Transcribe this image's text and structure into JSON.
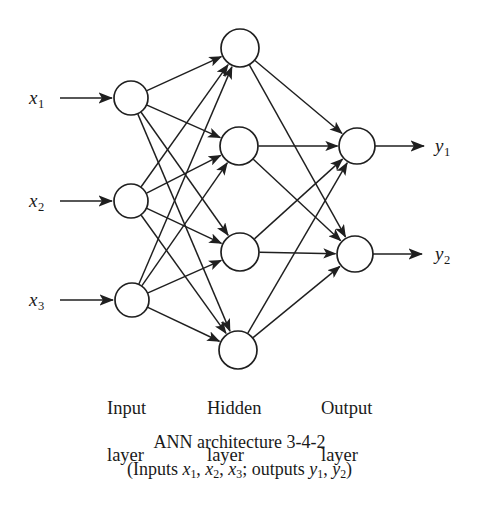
{
  "figure": {
    "title": "ANN architecture 3-4-2",
    "background_color": "#ffffff",
    "stroke_color": "#1f1f1f"
  },
  "inputs": [
    {
      "label": "x",
      "sub": "1",
      "node_id": "input-1"
    },
    {
      "label": "x",
      "sub": "2",
      "node_id": "input-2"
    },
    {
      "label": "x",
      "sub": "3",
      "node_id": "input-3"
    }
  ],
  "outputs": [
    {
      "label": "y",
      "sub": "1",
      "node_id": "output-1"
    },
    {
      "label": "y",
      "sub": "2",
      "node_id": "output-2"
    }
  ],
  "layer_labels": [
    {
      "line1": "Input",
      "line2": "layer"
    },
    {
      "line1": "Hidden",
      "line2": "layer"
    },
    {
      "line1": "Output",
      "line2": "layer"
    }
  ],
  "caption": {
    "line1": "ANN architecture 3-4-2",
    "line2_prefix": "(Inputs ",
    "line2_x1": "x",
    "line2_x1_sub": "1",
    "line2_sep1": ", ",
    "line2_x2": "x",
    "line2_x2_sub": "2",
    "line2_sep2": ", ",
    "line2_x3": "x",
    "line2_x3_sub": "3",
    "line2_mid": "; outputs ",
    "line2_y1": "y",
    "line2_y1_sub": "1",
    "line2_sep3": ", ",
    "line2_y2": "y",
    "line2_y2_sub": "2",
    "line2_suffix": ")"
  },
  "chart_data": {
    "type": "diagram",
    "title": "ANN architecture 3-4-2",
    "architecture": "3-4-2",
    "layers": [
      {
        "name": "Input layer",
        "count": 3,
        "nodes": [
          {
            "id": "input-1",
            "cx": 131,
            "cy": 98,
            "r": 17
          },
          {
            "id": "input-2",
            "cx": 131,
            "cy": 201,
            "r": 17
          },
          {
            "id": "input-3",
            "cx": 132,
            "cy": 300,
            "r": 17
          }
        ]
      },
      {
        "name": "Hidden layer",
        "count": 4,
        "nodes": [
          {
            "id": "hidden-1",
            "cx": 240,
            "cy": 48,
            "r": 19
          },
          {
            "id": "hidden-2",
            "cx": 239,
            "cy": 146,
            "r": 19
          },
          {
            "id": "hidden-3",
            "cx": 240,
            "cy": 252,
            "r": 19
          },
          {
            "id": "hidden-4",
            "cx": 238,
            "cy": 350,
            "r": 19
          }
        ]
      },
      {
        "name": "Output layer",
        "count": 2,
        "nodes": [
          {
            "id": "output-1",
            "cx": 357,
            "cy": 146,
            "r": 18
          },
          {
            "id": "output-2",
            "cx": 355,
            "cy": 254,
            "r": 18
          }
        ]
      }
    ],
    "edges": [
      {
        "from": "input-1",
        "to": "hidden-1"
      },
      {
        "from": "input-1",
        "to": "hidden-2"
      },
      {
        "from": "input-1",
        "to": "hidden-3"
      },
      {
        "from": "input-1",
        "to": "hidden-4"
      },
      {
        "from": "input-2",
        "to": "hidden-1"
      },
      {
        "from": "input-2",
        "to": "hidden-2"
      },
      {
        "from": "input-2",
        "to": "hidden-3"
      },
      {
        "from": "input-2",
        "to": "hidden-4"
      },
      {
        "from": "input-3",
        "to": "hidden-1"
      },
      {
        "from": "input-3",
        "to": "hidden-2"
      },
      {
        "from": "input-3",
        "to": "hidden-3"
      },
      {
        "from": "input-3",
        "to": "hidden-4"
      },
      {
        "from": "hidden-1",
        "to": "output-1"
      },
      {
        "from": "hidden-1",
        "to": "output-2"
      },
      {
        "from": "hidden-2",
        "to": "output-1"
      },
      {
        "from": "hidden-2",
        "to": "output-2"
      },
      {
        "from": "hidden-3",
        "to": "output-1"
      },
      {
        "from": "hidden-3",
        "to": "output-2"
      },
      {
        "from": "hidden-4",
        "to": "output-1"
      },
      {
        "from": "hidden-4",
        "to": "output-2"
      }
    ],
    "input_arrows": [
      {
        "label": "x1",
        "x1": 60,
        "x2": 112,
        "y": 98
      },
      {
        "label": "x2",
        "x1": 60,
        "x2": 112,
        "y": 201
      },
      {
        "label": "x3",
        "x1": 60,
        "x2": 113,
        "y": 300
      }
    ],
    "output_arrows": [
      {
        "label": "y1",
        "x1": 375,
        "x2": 424,
        "y": 146
      },
      {
        "label": "y2",
        "x1": 373,
        "x2": 422,
        "y": 254
      }
    ]
  }
}
